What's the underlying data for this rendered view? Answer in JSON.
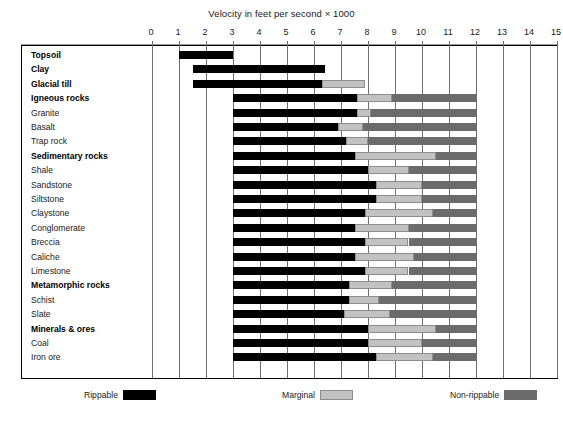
{
  "chart_data": {
    "type": "bar",
    "title": "Velocity in feet per second × 1000",
    "subtitle": "",
    "xlabel": "Velocity in feet per second × 1000",
    "ylabel": "",
    "orientation": "horizontal",
    "stacked": true,
    "xlim": [
      0,
      15
    ],
    "xticks": [
      0,
      1,
      2,
      3,
      4,
      5,
      6,
      7,
      8,
      9,
      10,
      11,
      12,
      13,
      14,
      15
    ],
    "xtick_labels": [
      "0",
      "1",
      "2",
      "3",
      "4",
      "5",
      "6",
      "7",
      "8",
      "9",
      "10",
      "11",
      "12",
      "13",
      "14",
      "15"
    ],
    "grid": true,
    "grid_axis": "x",
    "legend_position": "bottom",
    "series": [
      {
        "name": "Rippable",
        "color": "#000000"
      },
      {
        "name": "Marginal",
        "color": "#c2c2c2"
      },
      {
        "name": "Non-rippable",
        "color": "#6b6b6b"
      }
    ],
    "categories": [
      "Topsoil",
      "Clay",
      "Glacial till",
      "Igneous rocks",
      "Granite",
      "Basalt",
      "Trap rock",
      "Sedimentary rocks",
      "Shale",
      "Sandstone",
      "Siltstone",
      "Claystone",
      "Conglomerate",
      "Breccia",
      "Caliche",
      "Limestone",
      "Metamorphic rocks",
      "Schist",
      "Slate",
      "Minerals & ores",
      "Coal",
      "Iron ore"
    ],
    "rows": [
      {
        "label": "Topsoil",
        "group": true,
        "start": 1.0,
        "rippable_end": 3.0,
        "marginal_end": 3.0,
        "nonrippable_end": 3.0
      },
      {
        "label": "Clay",
        "group": true,
        "start": 1.5,
        "rippable_end": 6.4,
        "marginal_end": 6.4,
        "nonrippable_end": 6.4
      },
      {
        "label": "Glacial till",
        "group": true,
        "start": 1.5,
        "rippable_end": 6.3,
        "marginal_end": 7.9,
        "nonrippable_end": 7.9
      },
      {
        "label": "Igneous rocks",
        "group": true,
        "start": 3.0,
        "rippable_end": 7.6,
        "marginal_end": 8.9,
        "nonrippable_end": 12.0
      },
      {
        "label": "Granite",
        "group": false,
        "start": 3.0,
        "rippable_end": 7.6,
        "marginal_end": 8.1,
        "nonrippable_end": 12.0
      },
      {
        "label": "Basalt",
        "group": false,
        "start": 3.0,
        "rippable_end": 6.9,
        "marginal_end": 7.8,
        "nonrippable_end": 12.0
      },
      {
        "label": "Trap rock",
        "group": false,
        "start": 3.0,
        "rippable_end": 7.2,
        "marginal_end": 8.0,
        "nonrippable_end": 12.0
      },
      {
        "label": "Sedimentary rocks",
        "group": true,
        "start": 3.0,
        "rippable_end": 7.5,
        "marginal_end": 10.5,
        "nonrippable_end": 12.0
      },
      {
        "label": "Shale",
        "group": false,
        "start": 3.0,
        "rippable_end": 8.0,
        "marginal_end": 9.5,
        "nonrippable_end": 12.0
      },
      {
        "label": "Sandstone",
        "group": false,
        "start": 3.0,
        "rippable_end": 8.3,
        "marginal_end": 10.0,
        "nonrippable_end": 12.0
      },
      {
        "label": "Siltstone",
        "group": false,
        "start": 3.0,
        "rippable_end": 8.3,
        "marginal_end": 10.0,
        "nonrippable_end": 12.0
      },
      {
        "label": "Claystone",
        "group": false,
        "start": 3.0,
        "rippable_end": 7.9,
        "marginal_end": 10.4,
        "nonrippable_end": 12.0
      },
      {
        "label": "Conglomerate",
        "group": false,
        "start": 3.0,
        "rippable_end": 7.5,
        "marginal_end": 9.5,
        "nonrippable_end": 12.0
      },
      {
        "label": "Breccia",
        "group": false,
        "start": 3.0,
        "rippable_end": 7.9,
        "marginal_end": 9.5,
        "nonrippable_end": 12.0
      },
      {
        "label": "Caliche",
        "group": false,
        "start": 3.0,
        "rippable_end": 7.5,
        "marginal_end": 9.7,
        "nonrippable_end": 12.0
      },
      {
        "label": "Limestone",
        "group": false,
        "start": 3.0,
        "rippable_end": 7.9,
        "marginal_end": 9.5,
        "nonrippable_end": 12.0
      },
      {
        "label": "Metamorphic rocks",
        "group": true,
        "start": 3.0,
        "rippable_end": 7.3,
        "marginal_end": 8.9,
        "nonrippable_end": 12.0
      },
      {
        "label": "Schist",
        "group": false,
        "start": 3.0,
        "rippable_end": 7.3,
        "marginal_end": 8.4,
        "nonrippable_end": 12.0
      },
      {
        "label": "Slate",
        "group": false,
        "start": 3.0,
        "rippable_end": 7.1,
        "marginal_end": 8.8,
        "nonrippable_end": 12.0
      },
      {
        "label": "Minerals & ores",
        "group": true,
        "start": 3.0,
        "rippable_end": 8.0,
        "marginal_end": 10.5,
        "nonrippable_end": 12.0
      },
      {
        "label": "Coal",
        "group": false,
        "start": 3.0,
        "rippable_end": 8.0,
        "marginal_end": 10.0,
        "nonrippable_end": 12.0
      },
      {
        "label": "Iron ore",
        "group": false,
        "start": 3.0,
        "rippable_end": 8.3,
        "marginal_end": 10.4,
        "nonrippable_end": 12.0
      }
    ]
  },
  "legend": {
    "items": [
      {
        "label": "Rippable",
        "swatch": "rippable"
      },
      {
        "label": "Marginal",
        "swatch": "marginal"
      },
      {
        "label": "Non-rippable",
        "swatch": "nonrippable"
      }
    ]
  }
}
